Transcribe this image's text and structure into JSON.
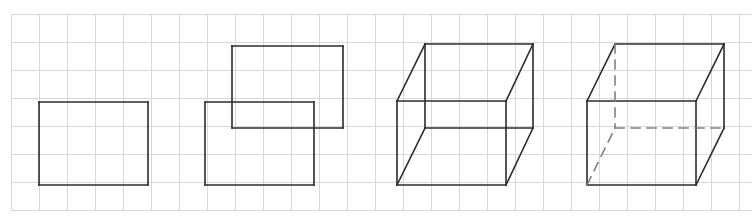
{
  "canvas": {
    "width": 752,
    "height": 220,
    "background_color": "#ffffff",
    "title": "Step-by-step cube drawing sequence on grid paper"
  },
  "grid": {
    "origin_x": 11,
    "origin_y": 14,
    "cell_size": 28,
    "columns": 27,
    "rows": 7,
    "line_color": "#d8d8da",
    "line_width": 1,
    "visible": true
  },
  "style": {
    "stroke_color": "#2b2b2b",
    "stroke_width": 1.6,
    "dashed_stroke_color": "#808086",
    "dash_pattern": "9,7"
  },
  "figures": [
    {
      "id": "figure-1",
      "label": "Step 1: front square face",
      "front_face": {
        "x": 39,
        "y": 102,
        "width": 109,
        "height": 83
      },
      "solid_edges": [
        {
          "name": "front-top-edge",
          "x1": 39,
          "y1": 102,
          "x2": 148,
          "y2": 102
        },
        {
          "name": "front-right-edge",
          "x1": 148,
          "y1": 102,
          "x2": 148,
          "y2": 185
        },
        {
          "name": "front-bottom-edge",
          "x1": 148,
          "y1": 185,
          "x2": 39,
          "y2": 185
        },
        {
          "name": "front-left-edge",
          "x1": 39,
          "y1": 185,
          "x2": 39,
          "y2": 102
        }
      ],
      "dashed_edges": []
    },
    {
      "id": "figure-2",
      "label": "Step 2: front face plus offset back face",
      "front_face": {
        "x": 205,
        "y": 102,
        "width": 109,
        "height": 83
      },
      "back_face": {
        "x": 232,
        "y": 46,
        "width": 111,
        "height": 82
      },
      "solid_edges": [
        {
          "name": "back-top-edge",
          "x1": 232,
          "y1": 46,
          "x2": 343,
          "y2": 46
        },
        {
          "name": "back-right-edge",
          "x1": 343,
          "y1": 46,
          "x2": 343,
          "y2": 128
        },
        {
          "name": "back-bottom-edge",
          "x1": 343,
          "y1": 128,
          "x2": 232,
          "y2": 128
        },
        {
          "name": "back-left-edge",
          "x1": 232,
          "y1": 128,
          "x2": 232,
          "y2": 46
        },
        {
          "name": "front-top-edge",
          "x1": 205,
          "y1": 102,
          "x2": 314,
          "y2": 102
        },
        {
          "name": "front-right-edge",
          "x1": 314,
          "y1": 102,
          "x2": 314,
          "y2": 185
        },
        {
          "name": "front-bottom-edge",
          "x1": 314,
          "y1": 185,
          "x2": 205,
          "y2": 185
        },
        {
          "name": "front-left-edge",
          "x1": 205,
          "y1": 185,
          "x2": 205,
          "y2": 102
        }
      ],
      "dashed_edges": []
    },
    {
      "id": "figure-3",
      "label": "Step 3: connecting edges, hidden edges erased",
      "front_face": {
        "x": 397,
        "y": 101,
        "width": 109,
        "height": 84
      },
      "back_face": {
        "x": 425,
        "y": 44,
        "width": 108,
        "height": 84
      },
      "solid_edges": [
        {
          "name": "back-top-edge",
          "x1": 425,
          "y1": 44,
          "x2": 533,
          "y2": 44
        },
        {
          "name": "back-right-edge",
          "x1": 533,
          "y1": 44,
          "x2": 533,
          "y2": 128
        },
        {
          "name": "back-left-edge",
          "x1": 425,
          "y1": 44,
          "x2": 425,
          "y2": 128
        },
        {
          "name": "back-bottom-edge",
          "x1": 425,
          "y1": 128,
          "x2": 533,
          "y2": 128
        },
        {
          "name": "front-top-edge",
          "x1": 397,
          "y1": 101,
          "x2": 506,
          "y2": 101
        },
        {
          "name": "front-right-edge",
          "x1": 506,
          "y1": 101,
          "x2": 506,
          "y2": 185
        },
        {
          "name": "front-bottom-edge",
          "x1": 506,
          "y1": 185,
          "x2": 397,
          "y2": 185
        },
        {
          "name": "front-left-edge",
          "x1": 397,
          "y1": 185,
          "x2": 397,
          "y2": 101
        },
        {
          "name": "connector-top-left",
          "x1": 397,
          "y1": 101,
          "x2": 425,
          "y2": 44
        },
        {
          "name": "connector-top-right",
          "x1": 506,
          "y1": 101,
          "x2": 533,
          "y2": 44
        },
        {
          "name": "connector-bottom-left",
          "x1": 397,
          "y1": 185,
          "x2": 425,
          "y2": 128
        },
        {
          "name": "connector-bottom-right",
          "x1": 506,
          "y1": 185,
          "x2": 533,
          "y2": 128
        }
      ],
      "dashed_edges": []
    },
    {
      "id": "figure-4",
      "label": "Step 4: finished cube with dashed hidden edges",
      "front_face": {
        "x": 587,
        "y": 101,
        "width": 109,
        "height": 84
      },
      "back_face": {
        "x": 615,
        "y": 44,
        "width": 109,
        "height": 84
      },
      "solid_edges": [
        {
          "name": "back-top-edge",
          "x1": 615,
          "y1": 44,
          "x2": 724,
          "y2": 44
        },
        {
          "name": "back-right-edge",
          "x1": 724,
          "y1": 44,
          "x2": 724,
          "y2": 128
        },
        {
          "name": "front-top-edge",
          "x1": 587,
          "y1": 101,
          "x2": 696,
          "y2": 101
        },
        {
          "name": "front-right-edge",
          "x1": 696,
          "y1": 101,
          "x2": 696,
          "y2": 185
        },
        {
          "name": "front-bottom-edge",
          "x1": 696,
          "y1": 185,
          "x2": 587,
          "y2": 185
        },
        {
          "name": "front-left-edge",
          "x1": 587,
          "y1": 185,
          "x2": 587,
          "y2": 101
        },
        {
          "name": "connector-top-left",
          "x1": 587,
          "y1": 101,
          "x2": 615,
          "y2": 44
        },
        {
          "name": "connector-top-right",
          "x1": 696,
          "y1": 101,
          "x2": 724,
          "y2": 44
        },
        {
          "name": "connector-bottom-right",
          "x1": 696,
          "y1": 185,
          "x2": 724,
          "y2": 128
        }
      ],
      "dashed_edges": [
        {
          "name": "hidden-back-left-vertical",
          "x1": 615,
          "y1": 44,
          "x2": 615,
          "y2": 128
        },
        {
          "name": "hidden-back-bottom-edge",
          "x1": 615,
          "y1": 128,
          "x2": 724,
          "y2": 128
        },
        {
          "name": "hidden-connector-bottom-left",
          "x1": 587,
          "y1": 185,
          "x2": 615,
          "y2": 128
        }
      ]
    }
  ]
}
